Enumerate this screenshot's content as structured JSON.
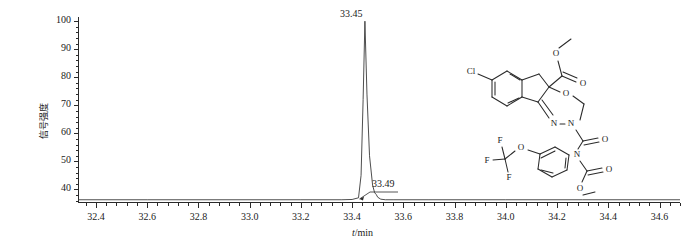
{
  "figure": {
    "kind": "chromatogram"
  },
  "axes": {
    "y_label": "信号强度",
    "x_label_italic": "t",
    "x_label_rest": "/min"
  },
  "annotations": {
    "main_peak": "33.45",
    "shoulder_peak": "33.49"
  },
  "molecule": {
    "labels": {
      "cl": "Cl",
      "o_ester_top": "O",
      "o_carbonyl_top": "O",
      "o_ring": "O",
      "n_imine": "N",
      "n_ring": "N",
      "o_amide": "O",
      "n_amide": "N",
      "o_carbamate_carbonyl": "O",
      "o_carbamate_ester": "O",
      "o_ocf3": "O",
      "f1": "F",
      "f2": "F",
      "f3": "F"
    }
  },
  "colors": {
    "axis": "#2a2a2a",
    "trace": "#3a3a3a",
    "structure": "#2b2b2b",
    "background": "#ffffff"
  },
  "chart_data": {
    "type": "line",
    "title": "",
    "xlabel": "t/min",
    "ylabel": "信号强度",
    "xlim": [
      32.33,
      34.68
    ],
    "ylim": [
      35.5,
      101.5
    ],
    "xticks": [
      32.4,
      32.6,
      32.8,
      33.0,
      33.2,
      33.4,
      33.6,
      33.8,
      34.0,
      34.2,
      34.4,
      34.6
    ],
    "xtick_labels": [
      "32.4",
      "32.6",
      "32.8",
      "33.0",
      "33.2",
      "33.4",
      "33.6",
      "33.8",
      "34.0",
      "34.2",
      "34.4",
      "34.6"
    ],
    "yticks": [
      40,
      50,
      60,
      70,
      80,
      90,
      100
    ],
    "ytick_labels": [
      "40",
      "50",
      "60",
      "70",
      "80",
      "90",
      "100"
    ],
    "minor_tick_interval_x": 0.04,
    "minor_tick_interval_y": 2,
    "grid": false,
    "legend": false,
    "peaks": [
      {
        "retention_time": 33.45,
        "height": 100,
        "label": "33.45"
      },
      {
        "retention_time": 33.49,
        "height": 38.5,
        "label": "33.49"
      }
    ],
    "series": [
      {
        "name": "TIC",
        "x": [
          32.33,
          32.6,
          32.9,
          33.2,
          33.36,
          33.4,
          33.425,
          33.435,
          33.443,
          33.45,
          33.458,
          33.468,
          33.48,
          33.488,
          33.494,
          33.5,
          33.512,
          33.53,
          33.56,
          33.7,
          34.0,
          34.3,
          34.68
        ],
        "y": [
          36.3,
          36.3,
          36.3,
          36.3,
          36.3,
          36.4,
          37.0,
          45.0,
          72.0,
          100.0,
          74.0,
          52.0,
          41.5,
          38.8,
          38.2,
          37.2,
          36.5,
          36.3,
          36.3,
          36.3,
          36.3,
          36.3,
          36.3
        ]
      }
    ]
  }
}
